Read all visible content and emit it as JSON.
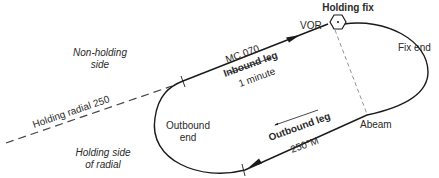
{
  "diagram": {
    "labels": {
      "holding_fix": "Holding fix",
      "vor": "VOR",
      "fix_end": "Fix end",
      "non_holding_side_1": "Non-holding",
      "non_holding_side_2": "side",
      "holding_side_1": "Holding side",
      "holding_side_2": "of radial",
      "holding_radial": "Holding radial 250",
      "inbound_course": "MC 070",
      "inbound_leg": "Inbound leg",
      "inbound_time": "1 minute",
      "outbound_end_1": "Outbound",
      "outbound_end_2": "end",
      "outbound_leg": "Outbound leg",
      "outbound_course": "250°M",
      "abeam": "Abeam"
    },
    "colors": {
      "line": "#1a1a1a",
      "dashed": "#555555",
      "text": "#2a2a2a",
      "background": "#ffffff"
    }
  }
}
